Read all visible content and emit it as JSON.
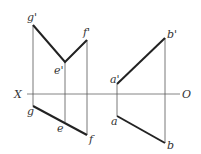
{
  "axis": {
    "left_label": "X",
    "right_label": "O",
    "y": 94,
    "x1": 27,
    "x2": 180
  },
  "colors": {
    "thick": "#222222",
    "thin": "#555555",
    "label": "#333333"
  },
  "left_figure": {
    "points": {
      "g_prime": {
        "label": "g'",
        "x": 33,
        "y": 25
      },
      "e_prime": {
        "label": "e'",
        "x": 65,
        "y": 62
      },
      "f_prime": {
        "label": "f'",
        "x": 87,
        "y": 40
      },
      "g": {
        "label": "g",
        "x": 33,
        "y": 106
      },
      "e": {
        "label": "e",
        "x": 65,
        "y": 122
      },
      "f": {
        "label": "f",
        "x": 87,
        "y": 135
      }
    }
  },
  "right_figure": {
    "points": {
      "a_prime": {
        "label": "a'",
        "x": 117,
        "y": 84
      },
      "b_prime": {
        "label": "b'",
        "x": 165,
        "y": 38
      },
      "a": {
        "label": "a",
        "x": 117,
        "y": 116
      },
      "b": {
        "label": "b",
        "x": 165,
        "y": 143
      }
    }
  }
}
